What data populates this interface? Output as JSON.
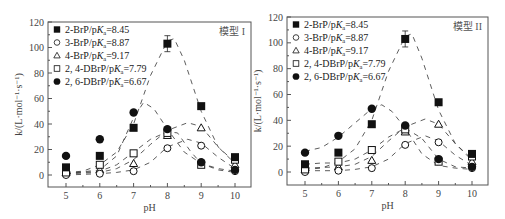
{
  "chart_data": [
    {
      "type": "scatter",
      "title": "模型 I",
      "xlabel": "pH",
      "ylabel": "k/(L·mol⁻¹·s⁻¹)",
      "xlim": [
        4.5,
        10.5
      ],
      "ylim": [
        -10,
        120
      ],
      "xticks": [
        5,
        6,
        7,
        8,
        9,
        10
      ],
      "yticks": [
        0,
        20,
        40,
        60,
        80,
        100,
        120
      ],
      "grid": false,
      "legend_position": "upper-left",
      "x": [
        5,
        6,
        7,
        8,
        9,
        10
      ],
      "series": [
        {
          "name": "2-BrP/pKa=8.45",
          "marker": "filled-square",
          "values": [
            6,
            15,
            37,
            103,
            54,
            14
          ]
        },
        {
          "name": "3-BrP/pKa=8.87",
          "marker": "open-circle",
          "values": [
            0,
            1,
            3,
            21,
            23,
            3
          ]
        },
        {
          "name": "4-BrP/pKa=9.17",
          "marker": "open-triangle",
          "values": [
            2,
            4,
            9,
            31,
            37,
            8
          ]
        },
        {
          "name": "2, 4-DBrP/pKa=7.79",
          "marker": "open-square",
          "values": [
            2,
            8,
            17,
            33,
            8,
            12
          ]
        },
        {
          "name": "2, 6-DBrP/pKa=6.67",
          "marker": "filled-circle",
          "values": [
            15,
            28,
            49,
            36,
            10,
            4
          ]
        }
      ],
      "fit_curves": "dashed model fits, 2-BrP peak ≈107 at pH 8.1, 2,6-DBrP peak ≈57 at pH 7.3"
    },
    {
      "type": "scatter",
      "title": "模型 II",
      "xlabel": "pH",
      "ylabel": "k/(L·mol⁻¹·s⁻¹)",
      "xlim": [
        4.5,
        10.5
      ],
      "ylim": [
        -10,
        120
      ],
      "xticks": [
        5,
        6,
        7,
        8,
        9,
        10
      ],
      "yticks": [
        0,
        20,
        40,
        60,
        80,
        100,
        120
      ],
      "grid": false,
      "legend_position": "upper-left",
      "x": [
        5,
        6,
        7,
        8,
        9,
        10
      ],
      "series": [
        {
          "name": "2-BrP/pKa=8.45",
          "marker": "filled-square",
          "values": [
            6,
            15,
            37,
            103,
            54,
            14
          ]
        },
        {
          "name": "3-BrP/pKa=8.87",
          "marker": "open-circle",
          "values": [
            0,
            1,
            3,
            21,
            23,
            3
          ]
        },
        {
          "name": "4-BrP/pKa=9.17",
          "marker": "open-triangle",
          "values": [
            2,
            4,
            9,
            31,
            37,
            8
          ]
        },
        {
          "name": "2, 4-DBrP/pKa=7.79",
          "marker": "open-square",
          "values": [
            2,
            8,
            17,
            33,
            8,
            12
          ]
        },
        {
          "name": "2, 6-DBrP/pKa=6.67",
          "marker": "filled-circle",
          "values": [
            15,
            28,
            49,
            36,
            10,
            4
          ]
        }
      ],
      "fit_curves": "dashed model fits, 2-BrP peak ≈107 at pH 8.1, 2,6-DBrP peak ≈52 at pH 7.2"
    }
  ],
  "legend": [
    {
      "prefix": "2-BrP/p",
      "k": "K",
      "sub": "a",
      "suffix": "=8.45"
    },
    {
      "prefix": "3-BrP/p",
      "k": "K",
      "sub": "a",
      "suffix": "=8.87"
    },
    {
      "prefix": "4-BrP/p",
      "k": "K",
      "sub": "a",
      "suffix": "=9.17"
    },
    {
      "prefix": "2, 4-DBrP/p",
      "k": "K",
      "sub": "a",
      "suffix": "=7.79"
    },
    {
      "prefix": "2, 6-DBrP/p",
      "k": "K",
      "sub": "a",
      "suffix": "=6.67"
    }
  ],
  "panels": [
    {
      "model_label": "模型 I"
    },
    {
      "model_label": "模型 II"
    }
  ],
  "axes": {
    "xlabel": "pH",
    "ylabel": "k/(L·mol⁻¹·s⁻¹)",
    "xticks": [
      "5",
      "6",
      "7",
      "8",
      "9",
      "10"
    ],
    "yticks": [
      "0",
      "20",
      "40",
      "60",
      "80",
      "100",
      "120"
    ]
  },
  "colors": {
    "marker": "#111111",
    "dash": "#333333",
    "frame": "#555555"
  }
}
